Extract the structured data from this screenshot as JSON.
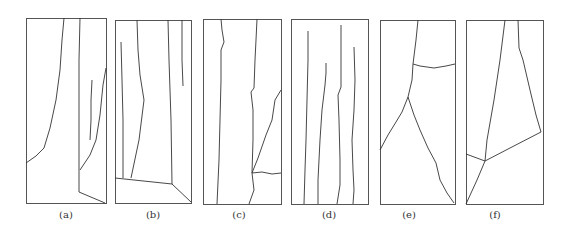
{
  "figure": {
    "stroke_color": "#333333",
    "panels": [
      {
        "label": "(a)",
        "box": [
          26,
          18,
          80,
          185
        ],
        "label_pos": [
          66,
          216
        ],
        "paths": [
          "M64,18 L62,40 L60,70 L56,100 L50,128 L44,148 L36,156 L26,163",
          "M80,18 L79,60 L79,120 L79,170 L79,192 L105,203",
          "M106,68 L103,85 L100,115 L96,140 L90,155 L80,170",
          "M92,80 L91,100 L91,120 L90,140"
        ]
      },
      {
        "label": "(b)",
        "box": [
          115,
          20,
          76,
          183
        ],
        "label_pos": [
          153,
          216
        ],
        "paths": [
          "M137,20 L138,50 L140,75 L144,100 L139,140 L131,178",
          "M121,42 L122,80 L123,120 L123,178",
          "M115,178 L172,184 L191,202",
          "M168,20 L169,60 L171,120 L172,184",
          "M182,20 L182,40 L182,60 L183,86"
        ]
      },
      {
        "label": "(c)",
        "box": [
          203,
          19,
          78,
          185
        ],
        "label_pos": [
          239,
          216
        ],
        "paths": [
          "M221,19 L222,30 L224,42 L221,50 L221,80 L220,120 L219,160 L217,204",
          "M257,19 L256,40 L255,60 L254,88 L251,92 L253,110 L253,140 L252,173 L254,190 L249,204",
          "M281,90 L275,100 L272,120 L266,135 L258,158 L252,173",
          "M252,173 L262,172 L272,174 L281,173"
        ]
      },
      {
        "label": "(d)",
        "box": [
          291,
          19,
          77,
          185
        ],
        "label_pos": [
          329,
          216
        ],
        "paths": [
          "M308,31 L308,60 L307,100 L306,140 L305,170 L304,204",
          "M326,63 L326,73 L325,85 L322,110 L320,140 L318,180 L318,204",
          "M341,25 L341,60 L341,87 L338,95 L339,120 L340,160 L340,185 L337,204",
          "M354,47 L355,80 L354,110 L352,140 L353,170 L354,190 L353,204"
        ]
      },
      {
        "label": "(e)",
        "box": [
          380,
          20,
          75,
          184
        ],
        "label_pos": [
          409,
          216
        ],
        "paths": [
          "M418,20 L416,40 L413,64 L412,80 L408,97",
          "M413,64 L420,66 L434,68 L446,66 L455,64",
          "M408,97 L402,112 L396,122 L388,135 L380,150",
          "M408,97 L414,115 L420,130 L428,148 L436,163 L440,180 L447,193 L454,203"
        ]
      },
      {
        "label": "(f)",
        "box": [
          466,
          20,
          77,
          184
        ],
        "label_pos": [
          495,
          216
        ],
        "paths": [
          "M505,20 L500,60 L494,100 L487,140 L485,161",
          "M518,20 L519,48 L523,60 L530,90 L536,115 L541,132",
          "M466,154 L485,161",
          "M485,161 L510,148 L541,132",
          "M485,161 L477,180 L466,204"
        ]
      }
    ]
  }
}
